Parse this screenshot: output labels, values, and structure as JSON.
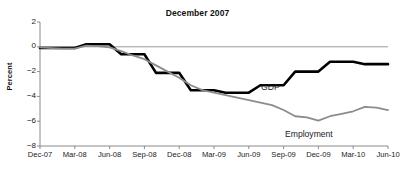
{
  "chart_data": {
    "type": "line",
    "title": "December 2007",
    "xlabel": "",
    "ylabel": "Percent",
    "ylim": [
      -8,
      2
    ],
    "yticks": [
      2,
      0,
      -2,
      -4,
      -6,
      -8
    ],
    "ytick_labels": [
      "2",
      "0",
      "−2",
      "−4",
      "−6",
      "−8"
    ],
    "grid": false,
    "zero_line": true,
    "legend": "inline-annotations",
    "categories": [
      "Dec-07",
      "Jan-08",
      "Feb-08",
      "Mar-08",
      "Apr-08",
      "May-08",
      "Jun-08",
      "Jul-08",
      "Aug-08",
      "Sep-08",
      "Oct-08",
      "Nov-08",
      "Dec-08",
      "Jan-09",
      "Feb-09",
      "Mar-09",
      "Apr-09",
      "May-09",
      "Jun-09",
      "Jul-09",
      "Aug-09",
      "Sep-09",
      "Oct-09",
      "Nov-09",
      "Dec-09",
      "Jan-10",
      "Feb-10",
      "Mar-10",
      "Apr-10",
      "May-10",
      "Jun-10"
    ],
    "xtick_labels": [
      "Dec-07",
      "Mar-08",
      "Jun-08",
      "Sep-08",
      "Dec-08",
      "Mar-09",
      "Jun-09",
      "Sep-09",
      "Dec-09",
      "Mar-10",
      "Jun-10"
    ],
    "xtick_indices": [
      0,
      3,
      6,
      9,
      12,
      15,
      18,
      21,
      24,
      27,
      30
    ],
    "series": [
      {
        "name": "GDP",
        "color": "#000000",
        "width": 2.6,
        "label_x_index": 19.2,
        "label_value": -2.9,
        "values": [
          -0.1,
          -0.1,
          -0.1,
          -0.1,
          0.2,
          0.2,
          0.2,
          -0.6,
          -0.6,
          -0.6,
          -2.1,
          -2.1,
          -2.1,
          -3.5,
          -3.5,
          -3.5,
          -3.7,
          -3.7,
          -3.7,
          -3.1,
          -3.1,
          -3.1,
          -2.0,
          -2.0,
          -2.0,
          -1.2,
          -1.2,
          -1.2,
          -1.4,
          -1.4,
          -1.4
        ]
      },
      {
        "name": "Employment",
        "color": "#8c8c8c",
        "width": 1.8,
        "label_x_index": 23.0,
        "label_value": -6.8,
        "values": [
          -0.05,
          -0.1,
          -0.15,
          -0.15,
          0.1,
          0.05,
          -0.05,
          -0.35,
          -0.7,
          -1.0,
          -1.5,
          -2.0,
          -2.5,
          -3.1,
          -3.5,
          -3.7,
          -3.9,
          -4.1,
          -4.3,
          -4.5,
          -4.7,
          -5.1,
          -5.6,
          -5.7,
          -5.95,
          -5.6,
          -5.4,
          -5.2,
          -4.85,
          -4.9,
          -5.1
        ]
      }
    ]
  }
}
